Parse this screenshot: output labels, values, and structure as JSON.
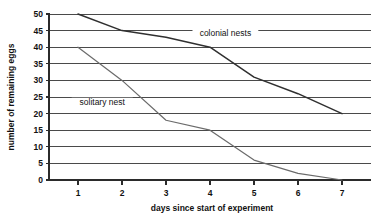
{
  "chart_data": {
    "type": "line",
    "title": "",
    "xlabel": "days since start of experiment",
    "ylabel": "number of remaining eggs",
    "xlim": [
      0.6,
      7.55
    ],
    "ylim": [
      0,
      50
    ],
    "xticks": [
      1,
      2,
      3,
      4,
      5,
      6,
      7
    ],
    "xtick_labels": [
      "1",
      "2",
      "3",
      "4",
      "5",
      "6",
      "7"
    ],
    "yticks": [
      0,
      5,
      10,
      15,
      20,
      25,
      30,
      35,
      40,
      45,
      50
    ],
    "ytick_labels": [
      "0",
      "5",
      "10",
      "15",
      "20",
      "25",
      "30",
      "35",
      "40",
      "45",
      "50"
    ],
    "grid": "horizontal",
    "legend_position": "inline-annotation",
    "series": [
      {
        "name": "colonial nests",
        "color": "#303030",
        "label_text": "colonial nests",
        "label_x": 4.35,
        "label_y": 43.5,
        "x": [
          1,
          2,
          3,
          4,
          5,
          6,
          7
        ],
        "values": [
          50,
          45,
          43,
          40,
          31,
          26,
          20
        ]
      },
      {
        "name": "solitary nest",
        "color": "#6b6b6b",
        "label_text": "solitary nest",
        "label_x": 1.55,
        "label_y": 22.5,
        "x": [
          1,
          2,
          3,
          4,
          5,
          6,
          7
        ],
        "values": [
          40,
          30,
          18,
          15,
          6,
          2,
          0
        ]
      }
    ],
    "annotations": [
      {
        "text": "colonial nests",
        "x": 4.35,
        "y": 43.5
      },
      {
        "text": "solitary nest",
        "x": 1.55,
        "y": 22.5
      }
    ]
  }
}
